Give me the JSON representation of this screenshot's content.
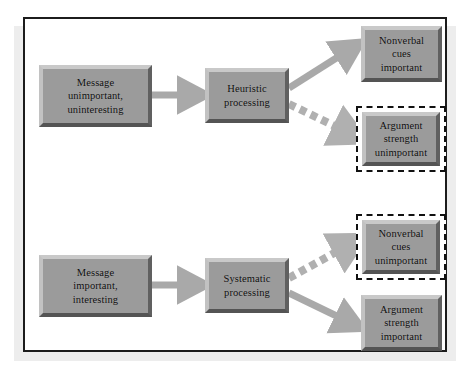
{
  "diagram": {
    "colors": {
      "page_background": "#ffffff",
      "page_shadow": "#ededed",
      "frame_border": "#1c1c1c",
      "box_fill": "#9b9b9b",
      "box_bevel_light": "#c9c9c9",
      "box_bevel_dark": "#545454",
      "box_text": "#0d0d0d",
      "arrow_solid": "#a9a9a9",
      "arrow_dashed": "#b0b0b0",
      "dashed_outline": "#111111"
    },
    "nodes": [
      {
        "id": "message-unimportant",
        "label": "Message\nunimportant,\nuninteresting",
        "style": "solid",
        "row": "top",
        "column": "input"
      },
      {
        "id": "heuristic-processing",
        "label": "Heuristic\nprocessing",
        "style": "solid",
        "row": "top",
        "column": "process"
      },
      {
        "id": "nonverbal-cues-important",
        "label": "Nonverbal\ncues\nimportant",
        "style": "solid",
        "row": "top",
        "column": "outcome-upper"
      },
      {
        "id": "argument-strength-unimportant",
        "label": "Argument\nstrength\nunimportant",
        "style": "dashed",
        "row": "top",
        "column": "outcome-lower"
      },
      {
        "id": "message-important",
        "label": "Message\nimportant,\ninteresting",
        "style": "solid",
        "row": "bottom",
        "column": "input"
      },
      {
        "id": "systematic-processing",
        "label": "Systematic\nprocessing",
        "style": "solid",
        "row": "bottom",
        "column": "process"
      },
      {
        "id": "nonverbal-cues-unimportant",
        "label": "Nonverbal\ncues\nunimportant",
        "style": "dashed",
        "row": "bottom",
        "column": "outcome-upper"
      },
      {
        "id": "argument-strength-important",
        "label": "Argument\nstrength\nimportant",
        "style": "solid",
        "row": "bottom",
        "column": "outcome-lower"
      }
    ],
    "connectors": [
      {
        "id": "top-input-to-process",
        "from": "message-unimportant",
        "to": "heuristic-processing",
        "style": "solid",
        "direction": "right"
      },
      {
        "id": "top-process-to-cues",
        "from": "heuristic-processing",
        "to": "nonverbal-cues-important",
        "style": "solid",
        "direction": "up-right"
      },
      {
        "id": "top-process-to-argument",
        "from": "heuristic-processing",
        "to": "argument-strength-unimportant",
        "style": "dashed",
        "direction": "down-right"
      },
      {
        "id": "bottom-input-to-process",
        "from": "message-important",
        "to": "systematic-processing",
        "style": "solid",
        "direction": "right"
      },
      {
        "id": "bottom-process-to-cues",
        "from": "systematic-processing",
        "to": "nonverbal-cues-unimportant",
        "style": "dashed",
        "direction": "up-right"
      },
      {
        "id": "bottom-process-to-arg",
        "from": "systematic-processing",
        "to": "argument-strength-important",
        "style": "solid",
        "direction": "down-right"
      }
    ]
  }
}
